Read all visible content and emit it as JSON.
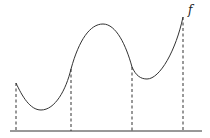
{
  "diagram": {
    "function_label": "f",
    "colors": {
      "stroke": "#333333",
      "background": "#ffffff"
    },
    "markers": [
      {
        "id": "x1",
        "x": 16,
        "curve_y": 83
      },
      {
        "id": "x2",
        "x": 71,
        "curve_y": 69
      },
      {
        "id": "x3",
        "x": 132,
        "curve_y": 67
      },
      {
        "id": "x4",
        "x": 183,
        "curve_y": 17
      }
    ]
  }
}
